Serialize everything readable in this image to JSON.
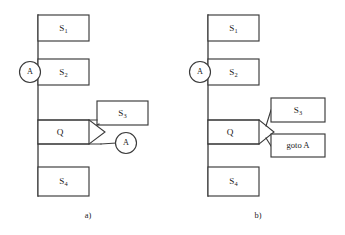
{
  "figure": {
    "background_color": "#ffffff",
    "ink_color": "#3a3a3a",
    "text_color": "#1c1c1c",
    "panels": [
      {
        "id": "panel-a",
        "caption": "a)",
        "spine": {
          "x": 38,
          "y_top": 15,
          "y_bottom": 196
        },
        "entry_connector": {
          "label": "A",
          "cx": 30,
          "cy": 72,
          "r": 10.5
        },
        "boxes": [
          {
            "name": "s1",
            "label": "S",
            "sub": "1",
            "x": 38,
            "y": 15,
            "w": 51,
            "h": 26
          },
          {
            "name": "s2",
            "label": "S",
            "sub": "2",
            "x": 38,
            "y": 59,
            "w": 51,
            "h": 26
          },
          {
            "name": "q",
            "label": "Q",
            "sub": "",
            "x": 38,
            "y": 120,
            "w": 51,
            "h": 24
          },
          {
            "name": "s3",
            "label": "S",
            "sub": "3",
            "x": 97,
            "y": 101,
            "w": 51,
            "h": 24
          },
          {
            "name": "s4",
            "label": "S",
            "sub": "4",
            "x": 38,
            "y": 167,
            "w": 51,
            "h": 29
          }
        ],
        "decision_chevron": {
          "x_left": 89,
          "x_tip": 105,
          "y_top": 120,
          "y_bottom": 144
        },
        "true_branch": {
          "x1": 105,
          "y1": 120,
          "x2": 123,
          "y2": 113
        },
        "false_branch": {
          "x1": 105,
          "y1": 144,
          "x2": 118,
          "y2": 143
        },
        "exit_connector": {
          "label": "A",
          "cx": 126,
          "cy": 143,
          "r": 10.5
        },
        "caption_pos": {
          "x": 88,
          "y": 216
        }
      },
      {
        "id": "panel-b",
        "caption": "b)",
        "spine": {
          "x": 208,
          "y_top": 15,
          "y_bottom": 196
        },
        "entry_connector": {
          "label": "A",
          "cx": 200,
          "cy": 72,
          "r": 10.5
        },
        "boxes": [
          {
            "name": "s1",
            "label": "S",
            "sub": "1",
            "x": 208,
            "y": 15,
            "w": 51,
            "h": 26
          },
          {
            "name": "s2",
            "label": "S",
            "sub": "2",
            "x": 208,
            "y": 59,
            "w": 51,
            "h": 26
          },
          {
            "name": "q",
            "label": "Q",
            "sub": "",
            "x": 208,
            "y": 120,
            "w": 51,
            "h": 24
          },
          {
            "name": "s3",
            "label": "S",
            "sub": "3",
            "x": 271,
            "y": 98,
            "w": 54,
            "h": 24
          },
          {
            "name": "s4",
            "label": "S",
            "sub": "4",
            "x": 208,
            "y": 167,
            "w": 51,
            "h": 29
          }
        ],
        "goto_box": {
          "name": "goto",
          "label": "goto A",
          "x": 271,
          "y": 134,
          "w": 54,
          "h": 23
        },
        "decision_chevron": {
          "x_left": 259,
          "x_tip": 274,
          "y_top": 120,
          "y_bottom": 144
        },
        "true_branch": {
          "x1": 269,
          "y1": 122,
          "x2": 271,
          "y2": 110
        },
        "false_branch": {
          "x1": 269,
          "y1": 140,
          "x2": 271,
          "y2": 146
        },
        "caption_pos": {
          "x": 258,
          "y": 216
        }
      }
    ]
  }
}
